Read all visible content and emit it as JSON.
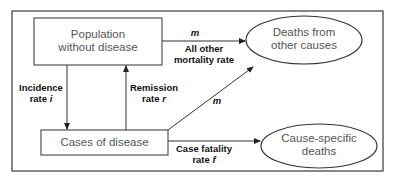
{
  "diagram": {
    "nodes": {
      "population": {
        "line1": "Population",
        "line2": "without disease"
      },
      "cases": {
        "label": "Cases of disease"
      },
      "deaths_other": {
        "line1": "Deaths from",
        "line2": "other causes"
      },
      "deaths_cause": {
        "line1": "Cause-specific",
        "line2": "deaths"
      }
    },
    "edges": {
      "incidence": {
        "line1": "Incidence",
        "line2_prefix": "rate ",
        "symbol": "i"
      },
      "remission": {
        "line1": "Remission",
        "line2_prefix": "rate ",
        "symbol": "r"
      },
      "other_mortality_top": {
        "symbol": "m",
        "line1": "All other",
        "line2": "mortality rate"
      },
      "other_mortality_cases": {
        "symbol": "m"
      },
      "case_fatality": {
        "line1": "Case fatality",
        "line2_prefix": "rate ",
        "symbol": "f"
      }
    },
    "colors": {
      "stroke": "#333333",
      "frame": "#555555",
      "node_text": "#555555",
      "label_text": "#111111"
    }
  }
}
